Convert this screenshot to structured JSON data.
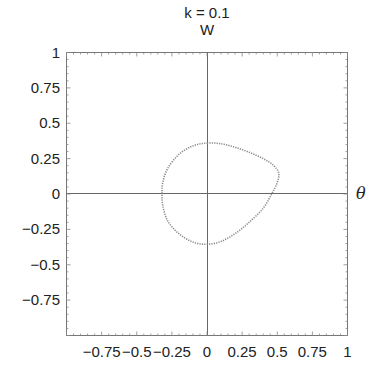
{
  "chart_data": {
    "type": "scatter",
    "title": "k = 0.1",
    "subtitle": "W",
    "xlabel": "θ",
    "ylabel": "",
    "xlim": [
      -1,
      1
    ],
    "ylim": [
      -1,
      1
    ],
    "grid": false,
    "axes_through_origin": true,
    "x_ticks": [
      "-0.75",
      "-0.5",
      "-0.25",
      "0",
      "0.25",
      "0.5",
      "0.75",
      "1"
    ],
    "y_ticks": [
      "1",
      "0.75",
      "0.5",
      "0.25",
      "0",
      "-0.25",
      "-0.5",
      "-0.75"
    ],
    "series": [
      {
        "name": "closed orbit",
        "style": "dotted gray",
        "color": "#8a8a8a",
        "points": [
          [
            0.0,
            0.36
          ],
          [
            0.1,
            0.355
          ],
          [
            0.2,
            0.33
          ],
          [
            0.3,
            0.295
          ],
          [
            0.4,
            0.25
          ],
          [
            0.47,
            0.205
          ],
          [
            0.51,
            0.15
          ],
          [
            0.5,
            0.08
          ],
          [
            0.46,
            0.0
          ],
          [
            0.4,
            -0.1
          ],
          [
            0.3,
            -0.2
          ],
          [
            0.2,
            -0.28
          ],
          [
            0.1,
            -0.335
          ],
          [
            0.0,
            -0.355
          ],
          [
            -0.1,
            -0.34
          ],
          [
            -0.2,
            -0.28
          ],
          [
            -0.28,
            -0.19
          ],
          [
            -0.315,
            -0.08
          ],
          [
            -0.32,
            0.0
          ],
          [
            -0.315,
            0.08
          ],
          [
            -0.28,
            0.18
          ],
          [
            -0.2,
            0.28
          ],
          [
            -0.1,
            0.34
          ],
          [
            0.0,
            0.36
          ]
        ]
      }
    ]
  }
}
